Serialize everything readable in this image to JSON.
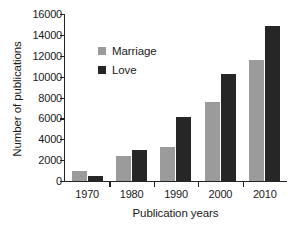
{
  "chart_data": {
    "type": "bar",
    "title": "",
    "subtitle": "",
    "xlabel": "Publication years",
    "ylabel": "Number of publications",
    "categories": [
      "1970",
      "1980",
      "1990",
      "2000",
      "2010"
    ],
    "series": [
      {
        "name": "Marriage",
        "color": "#9b9b9b",
        "values": [
          1000,
          2400,
          3300,
          7550,
          11600
        ]
      },
      {
        "name": "Love",
        "color": "#262626",
        "values": [
          500,
          3000,
          6100,
          10300,
          14850
        ]
      }
    ],
    "ylim": [
      0,
      16000
    ],
    "ytick_values": [
      0,
      2000,
      4000,
      6000,
      8000,
      10000,
      12000,
      14000,
      16000
    ],
    "ytick_labels": [
      "0",
      "2000",
      "4000",
      "6000",
      "8000",
      "10000",
      "12000",
      "14000",
      "16000"
    ],
    "grid": false,
    "legend_position": "upper-left-inside",
    "legend_entries": [
      "Marriage",
      "Love"
    ],
    "annotations": [],
    "axis_color": "#232323",
    "background_color": "#ffffff"
  }
}
